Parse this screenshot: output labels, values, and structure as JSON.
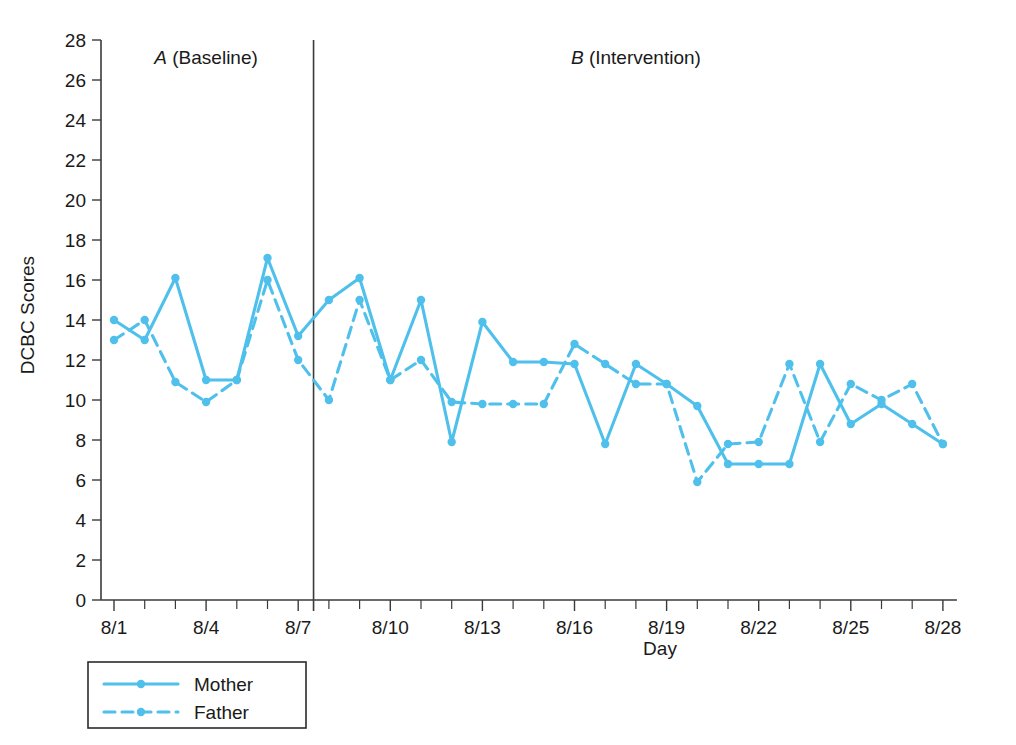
{
  "chart_data": {
    "type": "line",
    "title": "",
    "xlabel": "Day",
    "ylabel": "DCBC Scores",
    "ylim": [
      0,
      28
    ],
    "ytick_step": 2,
    "yticks": [
      0,
      2,
      4,
      6,
      8,
      10,
      12,
      14,
      16,
      18,
      20,
      22,
      24,
      26,
      28
    ],
    "grid": false,
    "legend_position": "below-left",
    "accent_color": "#4FC0EC",
    "axis_color": "#3a3a3a",
    "x": [
      "8/1",
      "8/2",
      "8/3",
      "8/4",
      "8/5",
      "8/6",
      "8/7",
      "8/8",
      "8/9",
      "8/10",
      "8/11",
      "8/12",
      "8/13",
      "8/14",
      "8/15",
      "8/16",
      "8/17",
      "8/18",
      "8/19",
      "8/20",
      "8/21",
      "8/22",
      "8/23",
      "8/24",
      "8/25",
      "8/26",
      "8/27",
      "8/28"
    ],
    "xtick_labels": [
      "8/1",
      "",
      "",
      "8/4",
      "",
      "",
      "8/7",
      "",
      "",
      "8/10",
      "",
      "",
      "8/13",
      "",
      "",
      "8/16",
      "",
      "",
      "8/19",
      "",
      "",
      "8/22",
      "",
      "",
      "8/25",
      "",
      "",
      "8/28"
    ],
    "phases": [
      {
        "label_italic": "A",
        "label_rest": " (Baseline)",
        "start": "8/1",
        "end": "8/7"
      },
      {
        "label_italic": "B",
        "label_rest": " (Intervention)",
        "start": "8/8",
        "end": "8/28"
      }
    ],
    "phase_divider_after": "8/7",
    "series": [
      {
        "name": "Mother",
        "style": "solid",
        "values": [
          14.0,
          13.0,
          16.1,
          11.0,
          11.0,
          17.1,
          13.2,
          15.0,
          16.1,
          11.0,
          15.0,
          7.9,
          13.9,
          11.9,
          11.9,
          11.8,
          7.8,
          11.8,
          10.8,
          9.7,
          6.8,
          6.8,
          6.8,
          11.8,
          8.8,
          9.8,
          8.8,
          7.8
        ]
      },
      {
        "name": "Father",
        "style": "dashed",
        "values": [
          13.0,
          14.0,
          10.9,
          9.9,
          11.0,
          16.0,
          12.0,
          10.0,
          15.0,
          11.0,
          12.0,
          9.9,
          9.8,
          9.8,
          9.8,
          12.8,
          11.8,
          10.8,
          10.8,
          5.9,
          7.8,
          7.9,
          11.8,
          7.9,
          10.8,
          10.0,
          10.8,
          7.8
        ]
      }
    ]
  },
  "legend": {
    "items": [
      {
        "label": "Mother",
        "style": "solid"
      },
      {
        "label": "Father",
        "style": "dashed"
      }
    ]
  }
}
